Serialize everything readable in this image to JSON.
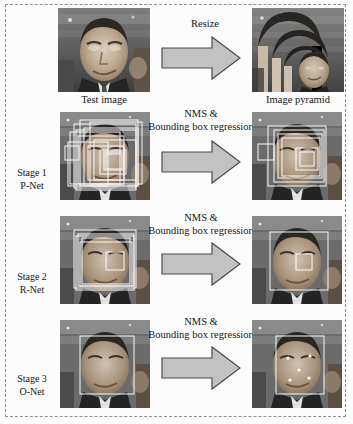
{
  "figure": {
    "frame_style": "dashed",
    "frame_color": "#8f8f8f",
    "background": "#fcfcfc"
  },
  "captions": {
    "test_image": "Test image",
    "image_pyramid": "Image pyramid"
  },
  "arrows": [
    {
      "id": "resize",
      "label_line1": "Resize",
      "label_line2": ""
    },
    {
      "id": "pnet-nms",
      "label_line1": "NMS &",
      "label_line2": "Bounding box regression"
    },
    {
      "id": "rnet-nms",
      "label_line1": "NMS &",
      "label_line2": "Bounding box regression"
    },
    {
      "id": "onet-nms",
      "label_line1": "NMS &",
      "label_line2": "Bounding box regression"
    }
  ],
  "stages": [
    {
      "id": "stage-1",
      "line1": "Stage 1",
      "line2": "P-Net"
    },
    {
      "id": "stage-2",
      "line1": "Stage 2",
      "line2": "R-Net"
    },
    {
      "id": "stage-3",
      "line1": "Stage 3",
      "line2": "O-Net"
    }
  ],
  "colors": {
    "arrow_fill": "#c2c2c2",
    "arrow_stroke": "#4a4a4a",
    "box_stroke": "#ffffff",
    "landmark": "#ffffff",
    "text": "#141414"
  },
  "panels": {
    "test_image": {
      "boxes": [],
      "landmarks": []
    },
    "image_pyramid": {
      "scales": [
        1.0,
        0.79,
        0.62,
        0.49,
        0.39
      ],
      "boxes": [],
      "landmarks": []
    },
    "pnet_in": {
      "box_count": 14,
      "boxes": [
        [
          14,
          12,
          62,
          64
        ],
        [
          20,
          8,
          58,
          66
        ],
        [
          10,
          20,
          50,
          52
        ],
        [
          24,
          16,
          54,
          58
        ],
        [
          18,
          24,
          46,
          48
        ],
        [
          30,
          10,
          52,
          62
        ],
        [
          8,
          30,
          40,
          44
        ],
        [
          34,
          28,
          42,
          40
        ],
        [
          28,
          34,
          36,
          34
        ],
        [
          40,
          38,
          26,
          24
        ],
        [
          44,
          40,
          20,
          18
        ],
        [
          5,
          34,
          14,
          14
        ],
        [
          46,
          42,
          16,
          15
        ],
        [
          16,
          18,
          60,
          60
        ]
      ],
      "landmarks": []
    },
    "pnet_out": {
      "box_count": 7,
      "boxes": [
        [
          16,
          14,
          58,
          60
        ],
        [
          22,
          18,
          50,
          52
        ],
        [
          26,
          22,
          44,
          44
        ],
        [
          30,
          26,
          38,
          38
        ],
        [
          6,
          32,
          16,
          16
        ],
        [
          44,
          36,
          22,
          22
        ],
        [
          48,
          40,
          14,
          14
        ]
      ],
      "landmarks": []
    },
    "rnet_in": {
      "box_count": 6,
      "boxes": [
        [
          14,
          14,
          62,
          58
        ],
        [
          18,
          18,
          56,
          52
        ],
        [
          22,
          22,
          48,
          46
        ],
        [
          20,
          26,
          52,
          44
        ],
        [
          16,
          20,
          58,
          54
        ],
        [
          46,
          36,
          18,
          18
        ]
      ],
      "landmarks": []
    },
    "rnet_out": {
      "box_count": 2,
      "boxes": [
        [
          18,
          16,
          58,
          58
        ],
        [
          44,
          38,
          16,
          16
        ]
      ],
      "landmarks": []
    },
    "onet_in": {
      "box_count": 1,
      "boxes": [
        [
          20,
          16,
          54,
          58
        ]
      ],
      "landmarks": []
    },
    "onet_out": {
      "box_count": 1,
      "boxes": [
        [
          24,
          16,
          48,
          58
        ]
      ],
      "landmark_count": 5,
      "landmarks": [
        [
          36,
          38
        ],
        [
          58,
          36
        ],
        [
          47,
          50
        ],
        [
          38,
          60
        ],
        [
          57,
          58
        ]
      ]
    }
  }
}
